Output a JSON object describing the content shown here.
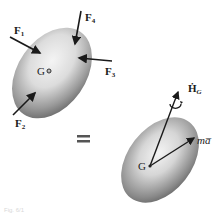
{
  "diagram": {
    "type": "free-body-and-kinetic-diagram",
    "equals_sign": "=",
    "free_body": {
      "center_label": "G",
      "forces": [
        {
          "id": "F1",
          "label": "F",
          "subscript": "1"
        },
        {
          "id": "F2",
          "label": "F",
          "subscript": "2"
        },
        {
          "id": "F3",
          "label": "F",
          "subscript": "3"
        },
        {
          "id": "F4",
          "label": "F",
          "subscript": "4"
        }
      ]
    },
    "kinetic": {
      "center_label": "G",
      "moment_label": "Ḣ",
      "moment_subscript": "G",
      "linear_label": "ma̅"
    },
    "caption": "Fig. 6/1"
  },
  "colors": {
    "body_light": "#f2f2f2",
    "body_dark": "#6e6e6e",
    "arrow": "#1a1a1a"
  }
}
